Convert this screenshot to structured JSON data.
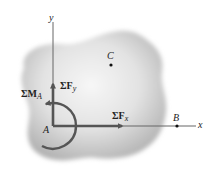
{
  "diagram": {
    "axes": {
      "x_label": "x",
      "y_label": "y"
    },
    "points": {
      "A": "A",
      "B": "B",
      "C": "C"
    },
    "forces": {
      "sum_fx": {
        "prefix": "ΣF",
        "sub": "x"
      },
      "sum_fy": {
        "prefix": "ΣF",
        "sub": "y"
      },
      "sum_ma": {
        "prefix": "ΣM",
        "sub": "A"
      }
    },
    "colors": {
      "body": "#bdbdbd",
      "body_highlight": "#f4f4f4",
      "arrow": "#555555",
      "axis": "#666666"
    }
  }
}
